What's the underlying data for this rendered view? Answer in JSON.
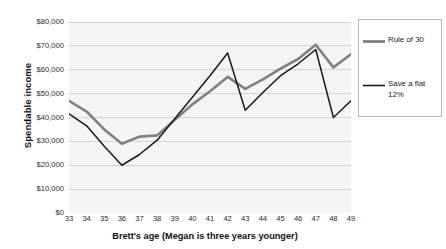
{
  "chart_data": {
    "type": "line",
    "title": "",
    "xlabel": "Brett's age (Megan is three years younger)",
    "ylabel": "Spendable income",
    "x": [
      33,
      34,
      35,
      36,
      37,
      38,
      39,
      40,
      41,
      42,
      43,
      44,
      45,
      46,
      47,
      48,
      49
    ],
    "categories": [
      "33",
      "34",
      "35",
      "36",
      "37",
      "38",
      "39",
      "40",
      "41",
      "42",
      "43",
      "44",
      "45",
      "46",
      "47",
      "48",
      "49"
    ],
    "xlim": [
      33,
      49
    ],
    "ylim": [
      0,
      80000
    ],
    "ytick_values": [
      0,
      10000,
      20000,
      30000,
      40000,
      50000,
      60000,
      70000,
      80000
    ],
    "ytick_labels": [
      "$0",
      "$10,000",
      "$20,000",
      "$30,000",
      "$40,000",
      "$50,000",
      "$60,000",
      "$70,000",
      "$80,000"
    ],
    "grid": "horizontal",
    "legend_position": "right-outside",
    "series": [
      {
        "name": "Rule of 30",
        "color": "#808080",
        "width": 2.6,
        "values": [
          47000,
          42500,
          35000,
          29000,
          32000,
          32500,
          39000,
          45500,
          51000,
          57000,
          52000,
          56000,
          60500,
          64500,
          70500,
          61000,
          66500
        ]
      },
      {
        "name": "Save a flat 12%",
        "color": "#1a1a1a",
        "width": 1.5,
        "values": [
          41500,
          36500,
          28000,
          20000,
          24500,
          30500,
          39500,
          48500,
          57500,
          67000,
          43000,
          50500,
          57500,
          62500,
          68500,
          40000,
          47000
        ]
      }
    ]
  },
  "legend": {
    "entries": [
      {
        "label": "Rule of 30"
      },
      {
        "label": "Save a flat 12%"
      }
    ]
  },
  "colors": {
    "plot_background": "#f4f4f4",
    "gridline": "#d2d2d2",
    "series_rule_of_30": "#808080",
    "series_flat_12": "#1a1a1a",
    "legend_border": "#b7b7b7",
    "text": "#1a1a1a"
  }
}
